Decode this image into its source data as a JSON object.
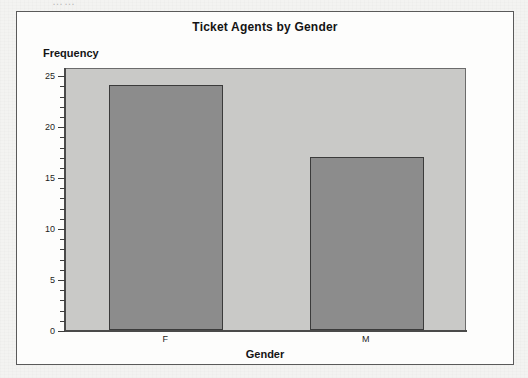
{
  "page": {
    "cropped_text_top": "……",
    "background_color": "#f3f3f1"
  },
  "figure": {
    "title": "Ticket Agents by Gender",
    "frame_color": "#5a5a5a",
    "plot_background_color": "#c9c9c7",
    "bar_fill_color": "#8c8c8c",
    "bar_edge_color": "#3b3b3b"
  },
  "chart_data": {
    "type": "bar",
    "title": "Ticket Agents by Gender",
    "xlabel": "Gender",
    "ylabel": "Frequency",
    "categories": [
      "F",
      "M"
    ],
    "values": [
      24,
      17
    ],
    "ylim": [
      0,
      25.8
    ],
    "ytick_labels": [
      "0",
      "5",
      "10",
      "15",
      "20",
      "25"
    ],
    "ytick_values": [
      0,
      5,
      10,
      15,
      20,
      25
    ],
    "yminor_tick_values": [
      1,
      2,
      3,
      4,
      6,
      7,
      8,
      9,
      11,
      12,
      13,
      14,
      16,
      17,
      18,
      19,
      21,
      22,
      23,
      24
    ],
    "grid": false,
    "legend": false
  }
}
